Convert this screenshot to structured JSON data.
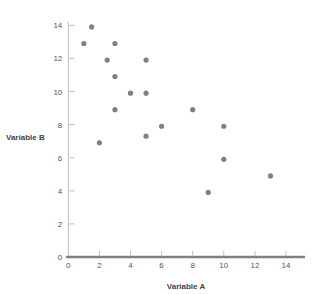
{
  "chart_data": {
    "type": "scatter",
    "title": "",
    "xlabel": "Variable A",
    "ylabel": "Variable B",
    "xlim": [
      0,
      15
    ],
    "ylim": [
      0,
      15
    ],
    "xticks": [
      0,
      2,
      4,
      6,
      8,
      10,
      12,
      14
    ],
    "yticks": [
      0,
      2,
      4,
      6,
      8,
      10,
      12,
      14
    ],
    "xtick_labels": [
      "0",
      "2",
      "4",
      "6",
      "8",
      "10",
      "12",
      "14"
    ],
    "ytick_labels": [
      "0",
      "2",
      "4",
      "6",
      "8",
      "10",
      "12",
      "14"
    ],
    "grid": false,
    "legend": null,
    "marker_color": "#808080",
    "axis_color": "#808080",
    "series": [
      {
        "name": "Variable B vs Variable A",
        "points": [
          {
            "x": 1.5,
            "y": 13.9
          },
          {
            "x": 1.0,
            "y": 12.9
          },
          {
            "x": 3.0,
            "y": 12.9
          },
          {
            "x": 2.5,
            "y": 11.9
          },
          {
            "x": 5.0,
            "y": 11.9
          },
          {
            "x": 3.0,
            "y": 10.9
          },
          {
            "x": 4.0,
            "y": 9.9
          },
          {
            "x": 5.0,
            "y": 9.9
          },
          {
            "x": 3.0,
            "y": 8.9
          },
          {
            "x": 8.0,
            "y": 8.9
          },
          {
            "x": 6.0,
            "y": 7.9
          },
          {
            "x": 10.0,
            "y": 7.9
          },
          {
            "x": 5.0,
            "y": 7.3
          },
          {
            "x": 2.0,
            "y": 6.9
          },
          {
            "x": 10.0,
            "y": 5.9
          },
          {
            "x": 13.0,
            "y": 4.9
          },
          {
            "x": 9.0,
            "y": 3.9
          }
        ]
      }
    ]
  },
  "axes": {
    "x_title": "Variable A",
    "y_title": "Variable B"
  }
}
